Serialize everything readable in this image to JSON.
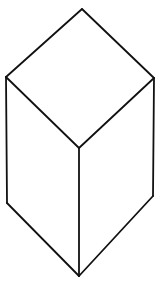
{
  "figure": {
    "stroke_color": "#111111",
    "background": "#ffffff",
    "vertices": {
      "top": [
        82,
        9
      ],
      "left": [
        6,
        77
      ],
      "right": [
        154,
        78
      ],
      "center": [
        79,
        148
      ],
      "bottom_left": [
        7,
        203
      ],
      "bottom_right": [
        153,
        196
      ],
      "bottom": [
        79,
        276
      ]
    },
    "faces": [
      {
        "name": "top-face",
        "points": "82,9 154,78 79,148 6,77"
      },
      {
        "name": "left-face",
        "points": "6,77 79,148 79,276 7,203"
      },
      {
        "name": "right-face",
        "points": "154,78 153,196 79,276 79,148"
      }
    ],
    "edges": [
      {
        "name": "edge-top-left",
        "d": "M82,9 L6,77"
      },
      {
        "name": "edge-top-right",
        "d": "M82,9 L154,78"
      },
      {
        "name": "edge-left-center",
        "d": "M6,77 L79,148"
      },
      {
        "name": "edge-right-center",
        "d": "M154,78 L79,148"
      },
      {
        "name": "edge-left-vertical",
        "d": "M6,77 L7,203"
      },
      {
        "name": "edge-right-vertical",
        "d": "M154,78 L153,196"
      },
      {
        "name": "edge-center-vertical",
        "d": "M79,148 L79,276"
      },
      {
        "name": "edge-bottom-left",
        "d": "M7,203 L79,276"
      },
      {
        "name": "edge-bottom-right",
        "d": "M153,196 L79,276"
      }
    ]
  }
}
